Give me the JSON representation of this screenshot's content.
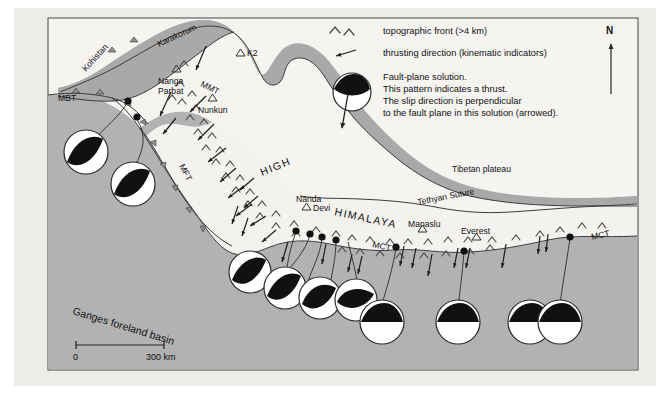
{
  "figure": {
    "type": "tectonic-map",
    "region": "Himalaya and Tibetan plateau"
  },
  "legend": {
    "items": [
      {
        "icon": "chevron-pair-icon",
        "label": "topographic front (>4 km)"
      },
      {
        "icon": "arrow-left-icon",
        "label": "thrusting direction (kinematic indicators)"
      }
    ],
    "beachball": {
      "icon": "focal-mechanism-icon",
      "lines": [
        "Fault-plane solution.",
        "This pattern indicates a thrust.",
        "The slip direction is perpendicular",
        "to the fault plane in this solution (arrowed)."
      ]
    },
    "north": {
      "label": "N",
      "icon": "north-arrow-icon"
    }
  },
  "map": {
    "regions": [
      {
        "name": "Kohistan",
        "label": "Kohistan"
      },
      {
        "name": "Karakorum",
        "label": "Karakorum"
      },
      {
        "name": "Tibetan plateau",
        "label": "Tibetan plateau"
      },
      {
        "name": "Ganges foreland basin",
        "label": "Ganges foreland basin"
      },
      {
        "name": "High Himalaya",
        "label_part1": "HIGH",
        "label_part2": "HIMALAYA"
      }
    ],
    "faults": [
      {
        "name": "MBT",
        "label": "MBT"
      },
      {
        "name": "MMT",
        "label": "MMT"
      },
      {
        "name": "MFT",
        "label": "MFT"
      },
      {
        "name": "MCT-west",
        "label": "MCT"
      },
      {
        "name": "MCT-east",
        "label": "MCT"
      },
      {
        "name": "Tethyan Suture",
        "label": "Tethyan Suture"
      }
    ],
    "peaks": [
      {
        "name": "K2",
        "label": "K2"
      },
      {
        "name": "Nanga Parbat",
        "label_line1": "Nanga",
        "label_line2": "Parbat"
      },
      {
        "name": "Nunkun",
        "label": "Nunkun"
      },
      {
        "name": "Nanda Devi",
        "label_line1": "Nanda",
        "label_line2": "Devi"
      },
      {
        "name": "Manaslu",
        "label": "Manaslu"
      },
      {
        "name": "Everest",
        "label": "Everest"
      }
    ],
    "scale": {
      "start": "0",
      "end": "300 km"
    }
  },
  "colors": {
    "page_background": "#ffffff",
    "panel_background": "#eeece8",
    "plateau": "#f6f4f1",
    "foreland_basin": "#b2b2b2",
    "mountain_band": "#a9a9a9",
    "high_himalaya": "#f2f0ed",
    "outline": "#3b3b3b",
    "beachball_dark": "#111111",
    "beachball_light": "#ffffff"
  }
}
